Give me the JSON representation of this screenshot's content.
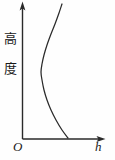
{
  "figure": {
    "kind": "line-diagram",
    "background_color": "#fefefe",
    "ink_color": "#2a2a2a",
    "axes": {
      "y_label": "高度",
      "y_label_chars": [
        "高",
        "度"
      ],
      "x_label": "h",
      "origin_label": "O",
      "y_axis_has_arrow": true,
      "x_axis_has_arrow": true,
      "tick_labels_x": [],
      "tick_labels_y": [],
      "grid": false
    }
  },
  "chart_data": {
    "type": "line",
    "title": "",
    "subtitle": "",
    "xlabel": "h",
    "ylabel": "高度",
    "xlim": [
      0,
      100
    ],
    "ylim": [
      0,
      100
    ],
    "grid": false,
    "legend": [],
    "annotations": [],
    "axis_tick_labels": {
      "x": [],
      "y": []
    },
    "series": [
      {
        "name": "curve",
        "comment": "C-shaped profile: starts at the horizontal axis on the right, bends leftward to a minimum in the lower-middle, then rises back rightward toward the top of the plot.",
        "x": [
          57,
          50,
          44,
          40,
          36,
          31,
          27,
          25,
          24,
          24,
          25,
          28,
          32,
          37,
          42,
          47,
          50
        ],
        "y": [
          0,
          5,
          11,
          17,
          24,
          35,
          45,
          52,
          57,
          62,
          68,
          75,
          81,
          87,
          92,
          97,
          100
        ]
      }
    ],
    "pixel_path": {
      "comment": "Curve traced in source-image pixel coordinates (115x160 canvas).",
      "points": [
        [
          68,
          138
        ],
        [
          62,
          130
        ],
        [
          56,
          120
        ],
        [
          51,
          110
        ],
        [
          47,
          100
        ],
        [
          44,
          90
        ],
        [
          42,
          80
        ],
        [
          41,
          72
        ],
        [
          42,
          64
        ],
        [
          44,
          55
        ],
        [
          47,
          45
        ],
        [
          51,
          34
        ],
        [
          55,
          24
        ],
        [
          59,
          13
        ],
        [
          62,
          4
        ]
      ]
    }
  }
}
